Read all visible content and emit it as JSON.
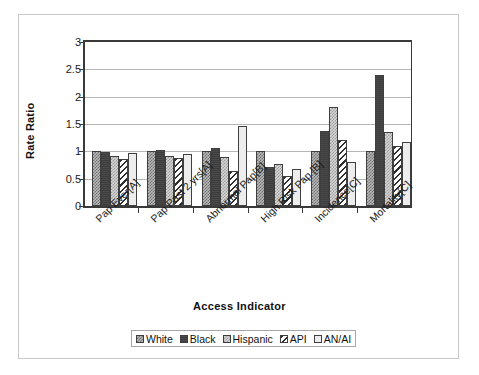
{
  "chart_data": {
    "type": "bar",
    "title": "",
    "xlabel": "Access  Indicator",
    "ylabel": "Rate Ratio",
    "ylim": [
      0,
      3
    ],
    "yticks": [
      "0",
      "0.5",
      "1",
      "1.5",
      "2",
      "2.5",
      "3"
    ],
    "grid": true,
    "legend_position": "bottom",
    "categories": [
      "Pap Ever[A]",
      "Pap Past 2 yrs[A]",
      "Abnormal Pap[B]",
      "High Risk Pap [B]",
      "Incidence[C]",
      "Mortality[C]"
    ],
    "series": [
      {
        "name": "White",
        "pattern": "crosshatch-gray",
        "values": [
          1.0,
          1.0,
          1.0,
          1.0,
          1.0,
          1.0
        ]
      },
      {
        "name": "Black",
        "pattern": "solid-dark",
        "values": [
          0.99,
          1.03,
          1.06,
          0.72,
          1.38,
          2.39
        ]
      },
      {
        "name": "Hispanic",
        "pattern": "fine-check-light",
        "values": [
          0.91,
          0.92,
          0.9,
          0.77,
          1.82,
          1.35
        ]
      },
      {
        "name": "API",
        "pattern": "diagonal-hatch",
        "values": [
          0.86,
          0.87,
          0.64,
          0.54,
          1.21,
          1.1
        ]
      },
      {
        "name": "AN/AI",
        "pattern": "solid-light",
        "values": [
          0.97,
          0.95,
          1.47,
          0.67,
          0.8,
          1.17
        ]
      }
    ]
  },
  "legend": {
    "items": [
      {
        "label": "White"
      },
      {
        "label": "Black"
      },
      {
        "label": "Hispanic"
      },
      {
        "label": "API"
      },
      {
        "label": "AN/AI"
      }
    ]
  },
  "axes": {
    "y_title": "Rate Ratio",
    "x_title": "Access  Indicator"
  }
}
